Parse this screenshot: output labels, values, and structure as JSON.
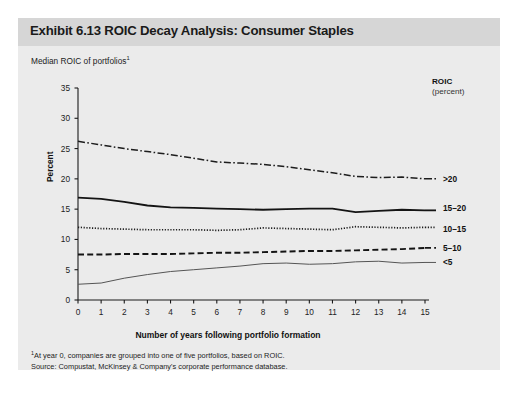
{
  "exhibit": {
    "title": "Exhibit 6.13 ROIC Decay Analysis: Consumer Staples",
    "subtitle": "Median ROIC of portfolios",
    "subtitle_superscript": "1"
  },
  "legend": {
    "heading": "ROIC",
    "subheading": "(percent)",
    "entries": [
      {
        "label": ">20",
        "style": "dash-dot"
      },
      {
        "label": "15–20",
        "style": "solid-bold"
      },
      {
        "label": "10–15",
        "style": "dotted"
      },
      {
        "label": "5–10",
        "style": "dashed"
      },
      {
        "label": "<5",
        "style": "solid-thin"
      }
    ]
  },
  "footnotes": {
    "line1_sup": "1",
    "line1": "At year 0, companies are grouped into one of five portfolios, based on ROIC.",
    "line2": "Source: Compustat, McKinsey & Company's corporate performance database."
  },
  "chart_data": {
    "type": "line",
    "title": "Exhibit 6.13 ROIC Decay Analysis: Consumer Staples",
    "subtitle": "Median ROIC of portfolios",
    "xlabel": "Number of years following portfolio formation",
    "ylabel": "Percent",
    "legend_title": "ROIC (percent)",
    "legend_position": "right",
    "grid": false,
    "x": [
      0,
      1,
      2,
      3,
      4,
      5,
      6,
      7,
      8,
      9,
      10,
      11,
      12,
      13,
      14,
      15
    ],
    "xlim": [
      0,
      15
    ],
    "ylim": [
      0,
      35
    ],
    "yticks": [
      0,
      5,
      10,
      15,
      20,
      25,
      30,
      35
    ],
    "xticks": [
      0,
      1,
      2,
      3,
      4,
      5,
      6,
      7,
      8,
      9,
      10,
      11,
      12,
      13,
      14,
      15
    ],
    "series": [
      {
        "name": ">20",
        "style": "dash-dot",
        "values": [
          26.2,
          25.6,
          25.0,
          24.5,
          24.0,
          23.4,
          22.8,
          22.6,
          22.4,
          22.0,
          21.5,
          21.0,
          20.4,
          20.2,
          20.3,
          20.0
        ]
      },
      {
        "name": "15–20",
        "style": "solid-bold",
        "values": [
          16.9,
          16.7,
          16.2,
          15.6,
          15.3,
          15.2,
          15.1,
          15.0,
          14.9,
          15.0,
          15.1,
          15.1,
          14.5,
          14.7,
          14.9,
          14.8
        ]
      },
      {
        "name": "10–15",
        "style": "dotted",
        "values": [
          12.0,
          11.8,
          11.7,
          11.6,
          11.6,
          11.6,
          11.5,
          11.6,
          11.9,
          11.8,
          11.7,
          11.6,
          12.1,
          12.0,
          11.9,
          12.0
        ]
      },
      {
        "name": "5–10",
        "style": "dashed",
        "values": [
          7.5,
          7.5,
          7.6,
          7.6,
          7.6,
          7.7,
          7.8,
          7.8,
          7.9,
          8.0,
          8.1,
          8.1,
          8.2,
          8.3,
          8.4,
          8.6
        ]
      },
      {
        "name": "<5",
        "style": "solid-thin",
        "values": [
          2.6,
          2.8,
          3.6,
          4.2,
          4.7,
          5.0,
          5.3,
          5.6,
          6.0,
          6.1,
          5.9,
          6.0,
          6.3,
          6.4,
          6.1,
          6.2
        ]
      }
    ]
  }
}
